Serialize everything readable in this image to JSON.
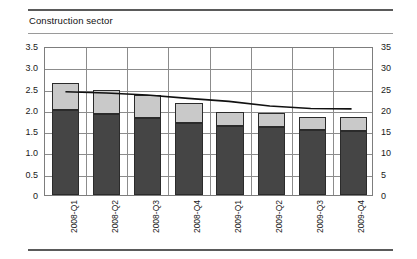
{
  "header": {
    "clipped_title": "2008 to 2009",
    "subtitle": "Construction sector"
  },
  "chart_data": {
    "type": "bar",
    "title": "Construction sector",
    "xlabel": "",
    "ylabel": "",
    "grid": true,
    "legend_position": "none",
    "categories": [
      "2008-Q1",
      "2008-Q2",
      "2008-Q3",
      "2008-Q4",
      "2009-Q1",
      "2009-Q2",
      "2009-Q3",
      "2009-Q4"
    ],
    "left_axis": {
      "ylim": [
        0,
        3.5
      ],
      "ticks": [
        "0",
        "0.5",
        "1.0",
        "1.5",
        "2.0",
        "2.5",
        "3.0",
        "3.5"
      ],
      "tick_values": [
        0,
        0.5,
        1.0,
        1.5,
        2.0,
        2.5,
        3.0,
        3.5
      ]
    },
    "right_axis": {
      "ylim": [
        0,
        35
      ],
      "ticks": [
        "0",
        "5",
        "10",
        "15",
        "20",
        "25",
        "30",
        "35"
      ],
      "tick_values": [
        0,
        5,
        10,
        15,
        20,
        25,
        30,
        35
      ]
    },
    "stacked": true,
    "series": [
      {
        "name": "lower-segment",
        "type": "bar",
        "axis": "left",
        "color": "#454545",
        "values": [
          2.0,
          1.9,
          1.82,
          1.68,
          1.62,
          1.6,
          1.52,
          1.5
        ]
      },
      {
        "name": "upper-segment",
        "type": "bar",
        "axis": "left",
        "color": "#c9c9c9",
        "values": [
          0.62,
          0.56,
          0.52,
          0.48,
          0.33,
          0.32,
          0.32,
          0.33
        ]
      },
      {
        "name": "line-series",
        "type": "line",
        "axis": "right",
        "color": "#111111",
        "values": [
          24.6,
          24.3,
          23.8,
          23.0,
          22.3,
          21.2,
          20.6,
          20.5
        ]
      }
    ],
    "bar_totals": [
      2.62,
      2.46,
      2.34,
      2.16,
      1.95,
      1.92,
      1.84,
      1.83
    ]
  }
}
